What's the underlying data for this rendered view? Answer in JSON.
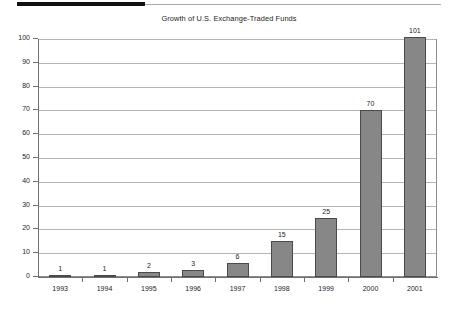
{
  "top_rule": {
    "name": "header-rule"
  },
  "chart_data": {
    "type": "bar",
    "title": "Growth of U.S. Exchange-Traded Funds",
    "xlabel": "",
    "ylabel": "",
    "categories": [
      "1993",
      "1994",
      "1995",
      "1996",
      "1997",
      "1998",
      "1999",
      "2000",
      "2001"
    ],
    "values": [
      1,
      1,
      2,
      3,
      6,
      15,
      25,
      70,
      101
    ],
    "data_labels": [
      "1",
      "1",
      "2",
      "3",
      "6",
      "15",
      "25",
      "70",
      "101"
    ],
    "ylim": [
      0,
      100
    ],
    "yticks": [
      0,
      10,
      20,
      30,
      40,
      50,
      60,
      70,
      80,
      90,
      100
    ],
    "ytick_labels": [
      "0",
      "10",
      "20",
      "30",
      "40",
      "50",
      "60",
      "70",
      "80",
      "90",
      "100"
    ],
    "grid": true,
    "grid_axis": "y",
    "legend": false,
    "bar_color": "#878787",
    "bar_edge_color": "#4a4a4a",
    "axis_color": "#6f6f6f",
    "grid_color": "#b4b4b4",
    "background": "#ffffff"
  }
}
